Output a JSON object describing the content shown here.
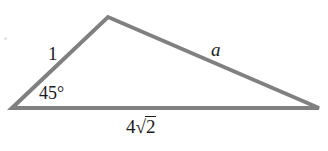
{
  "figure": {
    "background_color": "#ffffff",
    "stroke_color": "#808080",
    "stroke_width": 4,
    "text_color": "#1a1a1a",
    "width": 328,
    "height": 151
  },
  "geometry": {
    "vertices": {
      "left": {
        "x": 12,
        "y": 108
      },
      "apex": {
        "x": 108,
        "y": 17
      },
      "right": {
        "x": 319,
        "y": 108
      }
    },
    "sides": [
      {
        "name": "left-side",
        "from": "left",
        "to": "apex",
        "label": "1"
      },
      {
        "name": "hypotenuse-side",
        "from": "apex",
        "to": "right",
        "label": "a"
      },
      {
        "name": "base-side",
        "from": "left",
        "to": "right",
        "label": "4√2"
      }
    ]
  },
  "labels": {
    "side_short": "1",
    "side_unknown": "a",
    "angle": "45°",
    "base_coefficient": "4",
    "base_radical_sign": "√",
    "base_radicand": "2",
    "base_full": "4√2"
  }
}
